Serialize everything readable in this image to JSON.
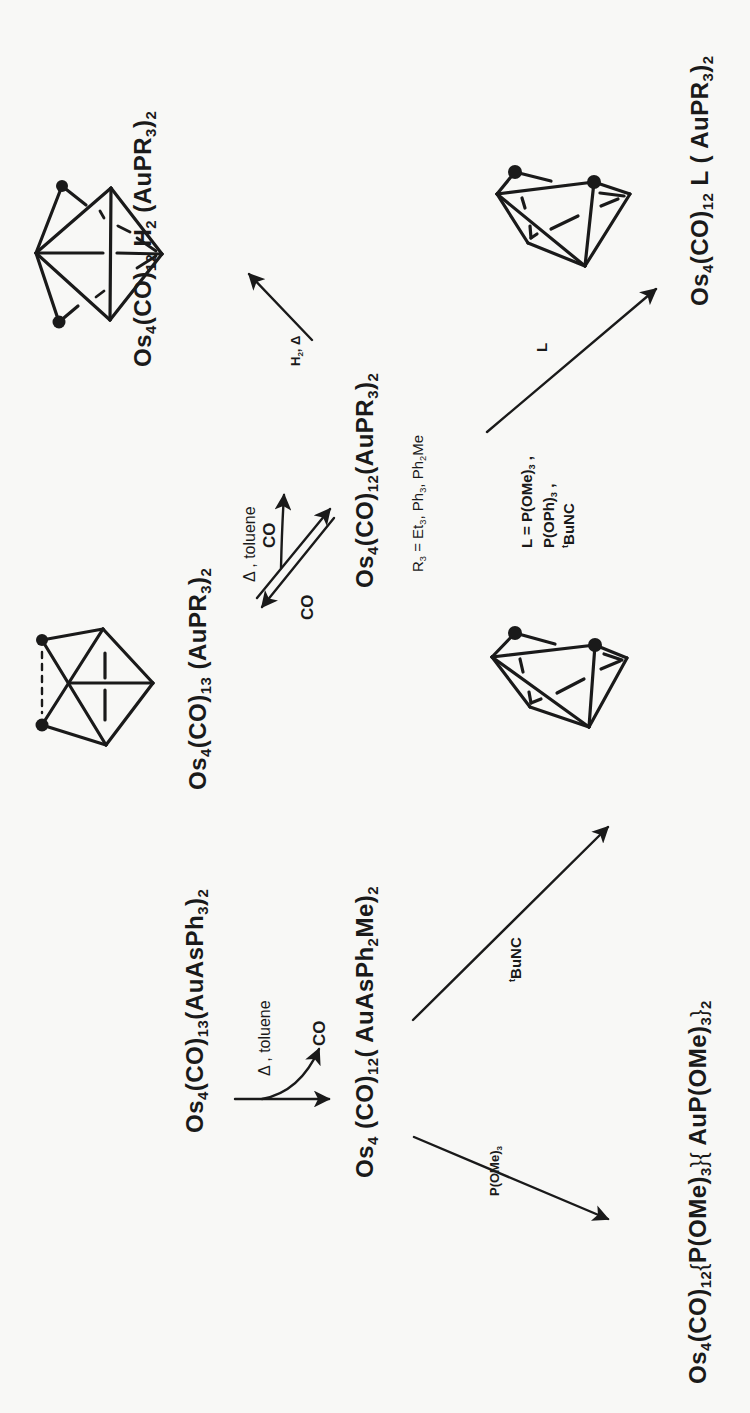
{
  "figure": {
    "orientation": "rotated -90deg (reads bottom-to-top)",
    "compounds": {
      "start": [
        {
          "t": "Os"
        },
        {
          "t": "4",
          "s": "sub"
        },
        {
          "t": "(CO)"
        },
        {
          "t": "13",
          "s": "sub"
        },
        {
          "t": "(AuAsPh"
        },
        {
          "t": "3",
          "s": "sub"
        },
        {
          "t": ")"
        },
        {
          "t": "2",
          "s": "sub"
        }
      ],
      "intermediate_as": [
        {
          "t": "Os"
        },
        {
          "t": "4",
          "s": "sub"
        },
        {
          "t": " (CO)"
        },
        {
          "t": "12",
          "s": "sub"
        },
        {
          "t": "( AuAsPh"
        },
        {
          "t": "2",
          "s": "sub"
        },
        {
          "t": "Me)"
        },
        {
          "t": "2",
          "s": "sub"
        }
      ],
      "product_pome3": [
        {
          "t": "Os"
        },
        {
          "t": "4",
          "s": "sub"
        },
        {
          "t": "(CO)"
        },
        {
          "t": "12",
          "s": "sub"
        },
        {
          "t": "{",
          "s": "brace"
        },
        {
          "t": "P(OMe)"
        },
        {
          "t": "3",
          "s": "sub"
        },
        {
          "t": "}{",
          "s": "brace"
        },
        {
          "t": " AuP(OMe)"
        },
        {
          "t": "3",
          "s": "sub"
        },
        {
          "t": "}",
          "s": "brace"
        },
        {
          "t": "2",
          "s": "sub"
        }
      ],
      "product_tbunc": [
        {
          "t": "Os"
        },
        {
          "t": "4",
          "s": "sub"
        },
        {
          "t": "(CO)"
        },
        {
          "t": "12",
          "s": "sub"
        },
        {
          "t": "("
        },
        {
          "t": "t",
          "s": "sup"
        },
        {
          "t": "BuNC)(AuAsPh"
        },
        {
          "t": "2",
          "s": "sub"
        },
        {
          "t": "Me)"
        },
        {
          "t": "2",
          "s": "sub"
        }
      ],
      "co13_aupr3": [
        {
          "t": "Os"
        },
        {
          "t": "4",
          "s": "sub"
        },
        {
          "t": "(CO)"
        },
        {
          "t": "13",
          "s": "sub"
        },
        {
          "t": " (AuPR"
        },
        {
          "t": "3",
          "s": "sub"
        },
        {
          "t": ")"
        },
        {
          "t": "2",
          "s": "sub"
        }
      ],
      "co12_aupr3": [
        {
          "t": "Os"
        },
        {
          "t": "4",
          "s": "sub"
        },
        {
          "t": "(CO)"
        },
        {
          "t": "12",
          "s": "sub"
        },
        {
          "t": "(AuPR"
        },
        {
          "t": "3",
          "s": "sub"
        },
        {
          "t": ")"
        },
        {
          "t": "2",
          "s": "sub"
        }
      ],
      "h2_product": [
        {
          "t": "Os"
        },
        {
          "t": "4",
          "s": "sub"
        },
        {
          "t": "(CO)"
        },
        {
          "t": "12",
          "s": "sub"
        },
        {
          "t": " H"
        },
        {
          "t": "2",
          "s": "sub"
        },
        {
          "t": " (AuPR"
        },
        {
          "t": "3",
          "s": "sub"
        },
        {
          "t": ")"
        },
        {
          "t": "2",
          "s": "sub"
        }
      ],
      "l_product": [
        {
          "t": "Os"
        },
        {
          "t": "4",
          "s": "sub"
        },
        {
          "t": "(CO)"
        },
        {
          "t": "12",
          "s": "sub"
        },
        {
          "t": " L ( AuPR"
        },
        {
          "t": "3",
          "s": "sub"
        },
        {
          "t": ")"
        },
        {
          "t": "2",
          "s": "sub"
        }
      ]
    },
    "conditions": {
      "heat_toluene_top": [
        {
          "t": "Δ , toluene"
        }
      ],
      "co_loss_top": [
        {
          "t": "CO"
        }
      ],
      "co_add_top": [
        {
          "t": "CO"
        }
      ],
      "r3_definition": [
        {
          "t": "R"
        },
        {
          "t": "3",
          "s": "sub"
        },
        {
          "t": " = Et"
        },
        {
          "t": "3",
          "s": "sub"
        },
        {
          "t": ", Ph"
        },
        {
          "t": "3",
          "s": "sub"
        },
        {
          "t": ", Ph"
        },
        {
          "t": "2",
          "s": "sub"
        },
        {
          "t": "Me"
        }
      ],
      "h2_heat": [
        {
          "t": "H"
        },
        {
          "t": "2",
          "s": "sub"
        },
        {
          "t": ", Δ"
        }
      ],
      "l_reagent": [
        {
          "t": "L"
        }
      ],
      "l_def_line1": [
        {
          "t": "L = P(OMe)"
        },
        {
          "t": "3",
          "s": "sub"
        },
        {
          "t": " ,"
        }
      ],
      "l_def_line2": [
        {
          "t": "P(OPh)"
        },
        {
          "t": "3",
          "s": "sub"
        },
        {
          "t": " ,"
        }
      ],
      "l_def_line3": [
        {
          "t": "t",
          "s": "sup"
        },
        {
          "t": "BuNC"
        }
      ],
      "tbunc_reagent": [
        {
          "t": "t",
          "s": "sup"
        },
        {
          "t": "BuNC"
        }
      ],
      "pome3_reagent": [
        {
          "t": "P(OMe)"
        },
        {
          "t": "3",
          "s": "sub"
        }
      ],
      "heat_toluene_bottom": [
        {
          "t": "Δ , toluene"
        }
      ],
      "co_loss_bottom": [
        {
          "t": "CO"
        }
      ]
    },
    "structures": [
      {
        "name": "octahedral-cluster-h2",
        "gold_atoms": 2
      },
      {
        "name": "butterfly-cluster-co13",
        "gold_atoms": 2
      },
      {
        "name": "tetrahedral-cluster-l",
        "gold_atoms": 2
      },
      {
        "name": "tetrahedral-cluster-tbunc",
        "gold_atoms": 2
      }
    ],
    "colors": {
      "ink": "#1a1a1a",
      "paper": "#f8f8f6"
    }
  }
}
